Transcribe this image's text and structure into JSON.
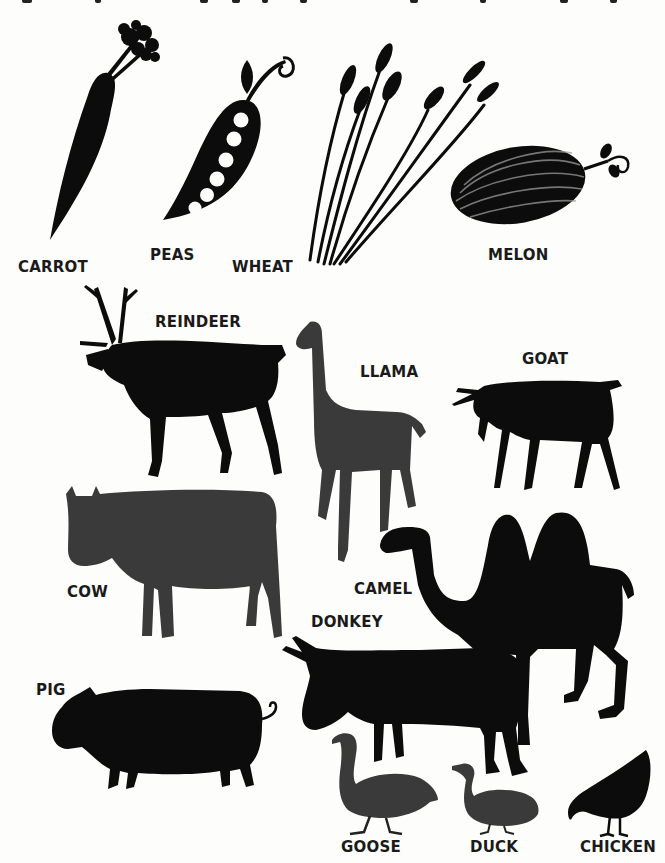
{
  "page": {
    "background": "#fdfdfc",
    "ink_color": "#0c0c0c",
    "gray_ink_color": "#3a3a3a",
    "top_text_cropped": true
  },
  "illustrations": {
    "plants": [
      {
        "id": "carrot",
        "label": "CARROT",
        "icon": "carrot-icon"
      },
      {
        "id": "peas",
        "label": "PEAS",
        "icon": "pea-pod-icon"
      },
      {
        "id": "wheat",
        "label": "WHEAT",
        "icon": "wheat-icon"
      },
      {
        "id": "melon",
        "label": "MELON",
        "icon": "melon-icon"
      }
    ],
    "animals": [
      {
        "id": "reindeer",
        "label": "REINDEER",
        "icon": "reindeer-icon"
      },
      {
        "id": "llama",
        "label": "LLAMA",
        "icon": "llama-icon"
      },
      {
        "id": "goat",
        "label": "GOAT",
        "icon": "goat-icon"
      },
      {
        "id": "cow",
        "label": "COW",
        "icon": "cow-icon"
      },
      {
        "id": "camel",
        "label": "CAMEL",
        "icon": "camel-icon"
      },
      {
        "id": "donkey",
        "label": "DONKEY",
        "icon": "donkey-icon"
      },
      {
        "id": "pig",
        "label": "PIG",
        "icon": "pig-icon"
      },
      {
        "id": "goose",
        "label": "GOOSE",
        "icon": "goose-icon"
      },
      {
        "id": "duck",
        "label": "DUCK",
        "icon": "duck-icon"
      },
      {
        "id": "chicken",
        "label": "CHICKEN",
        "icon": "chicken-icon"
      }
    ]
  }
}
